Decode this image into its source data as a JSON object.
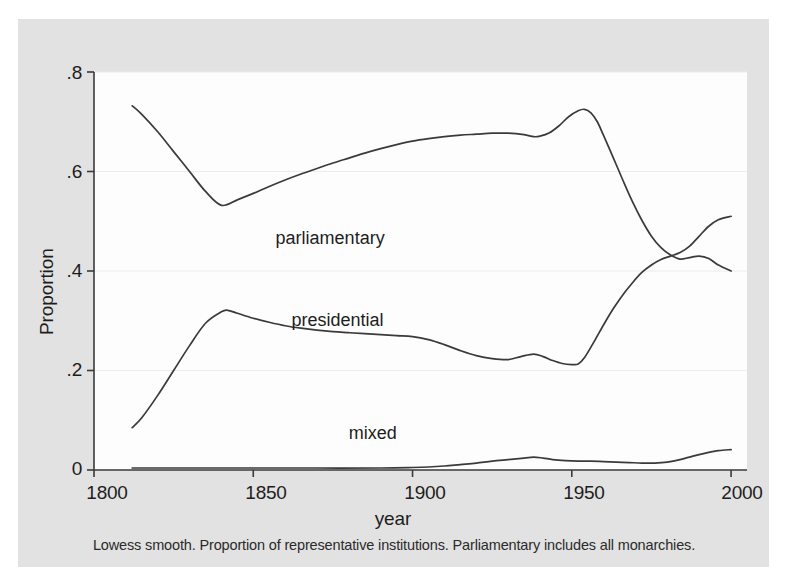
{
  "chart_data": {
    "type": "line",
    "title": "",
    "subtitle": "",
    "xlabel": "year",
    "ylabel": "Proportion",
    "caption": "Lowess smooth. Proportion of representative institutions. Parliamentary includes all monarchies.",
    "xlim": [
      1800,
      2005
    ],
    "ylim": [
      0,
      0.8
    ],
    "xticks": [
      1800,
      1850,
      1900,
      1950,
      2000
    ],
    "xtick_labels": [
      "1800",
      "1850",
      "1900",
      "1950",
      "2000"
    ],
    "yticks": [
      0,
      0.2,
      0.4,
      0.6,
      0.8
    ],
    "ytick_labels": [
      "0",
      ".2",
      ".4",
      ".6",
      ".8"
    ],
    "grid": "horizontal",
    "legend_position": "inline-annotations",
    "line_color": "#3a3a3a",
    "series": [
      {
        "name": "parliamentary",
        "label": "parliamentary",
        "label_x": 1857,
        "label_y": 0.465,
        "x": [
          1812,
          1815,
          1820,
          1825,
          1830,
          1835,
          1840,
          1845,
          1850,
          1855,
          1860,
          1865,
          1870,
          1875,
          1880,
          1885,
          1890,
          1895,
          1900,
          1905,
          1910,
          1915,
          1920,
          1925,
          1930,
          1935,
          1938,
          1940,
          1943,
          1946,
          1949,
          1952,
          1954,
          1956,
          1958,
          1960,
          1963,
          1966,
          1969,
          1972,
          1975,
          1978,
          1981,
          1984,
          1987,
          1990,
          1993,
          1996,
          2000
        ],
        "y": [
          0.732,
          0.715,
          0.68,
          0.64,
          0.6,
          0.56,
          0.532,
          0.543,
          0.556,
          0.57,
          0.583,
          0.595,
          0.606,
          0.617,
          0.627,
          0.637,
          0.646,
          0.654,
          0.661,
          0.666,
          0.67,
          0.673,
          0.675,
          0.677,
          0.677,
          0.674,
          0.67,
          0.671,
          0.678,
          0.692,
          0.71,
          0.722,
          0.725,
          0.718,
          0.7,
          0.672,
          0.628,
          0.583,
          0.54,
          0.502,
          0.47,
          0.447,
          0.432,
          0.424,
          0.427,
          0.43,
          0.425,
          0.412,
          0.4
        ]
      },
      {
        "name": "presidential",
        "label": "presidential",
        "label_x": 1862,
        "label_y": 0.3,
        "x": [
          1812,
          1815,
          1820,
          1825,
          1830,
          1835,
          1840,
          1842,
          1845,
          1850,
          1855,
          1860,
          1865,
          1870,
          1875,
          1880,
          1885,
          1890,
          1895,
          1900,
          1905,
          1910,
          1915,
          1920,
          1925,
          1930,
          1934,
          1938,
          1941,
          1944,
          1947,
          1950,
          1952,
          1954,
          1957,
          1960,
          1963,
          1966,
          1969,
          1972,
          1975,
          1978,
          1981,
          1984,
          1987,
          1990,
          1993,
          1996,
          2000
        ],
        "y": [
          0.085,
          0.105,
          0.15,
          0.2,
          0.25,
          0.295,
          0.318,
          0.321,
          0.315,
          0.305,
          0.297,
          0.29,
          0.285,
          0.281,
          0.278,
          0.276,
          0.274,
          0.272,
          0.27,
          0.268,
          0.262,
          0.252,
          0.24,
          0.23,
          0.224,
          0.222,
          0.228,
          0.233,
          0.228,
          0.22,
          0.214,
          0.212,
          0.213,
          0.226,
          0.258,
          0.292,
          0.324,
          0.352,
          0.376,
          0.397,
          0.412,
          0.423,
          0.43,
          0.437,
          0.45,
          0.47,
          0.49,
          0.503,
          0.51
        ]
      },
      {
        "name": "mixed",
        "label": "mixed",
        "label_x": 1880,
        "label_y": 0.072,
        "x": [
          1812,
          1830,
          1850,
          1870,
          1890,
          1900,
          1905,
          1910,
          1915,
          1920,
          1925,
          1930,
          1935,
          1938,
          1941,
          1944,
          1948,
          1952,
          1956,
          1960,
          1964,
          1968,
          1972,
          1976,
          1980,
          1984,
          1988,
          1992,
          1996,
          2000
        ],
        "y": [
          0.004,
          0.004,
          0.004,
          0.004,
          0.004,
          0.005,
          0.006,
          0.008,
          0.011,
          0.014,
          0.018,
          0.021,
          0.024,
          0.026,
          0.024,
          0.021,
          0.019,
          0.018,
          0.018,
          0.017,
          0.016,
          0.015,
          0.014,
          0.014,
          0.016,
          0.021,
          0.028,
          0.034,
          0.039,
          0.041
        ]
      }
    ]
  }
}
